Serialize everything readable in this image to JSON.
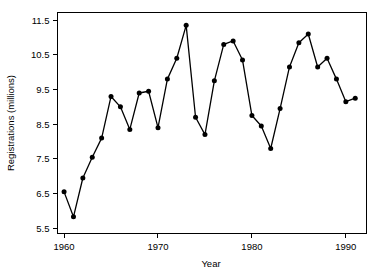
{
  "chart_data": {
    "type": "line",
    "title": "",
    "xlabel": "Year",
    "ylabel": "Registrations (millions)",
    "xlim": [
      1959.3,
      1992.2
    ],
    "ylim": [
      5.35,
      11.72
    ],
    "xticks": [
      1960,
      1970,
      1980,
      1990
    ],
    "xtick_labels": [
      "1960",
      "1970",
      "1980",
      "1990"
    ],
    "yticks": [
      5.5,
      6.5,
      7.5,
      8.5,
      9.5,
      10.5,
      11.5
    ],
    "ytick_labels": [
      "5.5",
      "6.5",
      "7.5",
      "8.5",
      "9.5",
      "10.5",
      "11.5"
    ],
    "grid": false,
    "legend": false,
    "marker": "filled-circle",
    "line_color": "#000000",
    "marker_color": "#000000",
    "background": "#ffffff",
    "x": [
      1960,
      1961,
      1962,
      1963,
      1964,
      1965,
      1966,
      1967,
      1968,
      1969,
      1970,
      1971,
      1972,
      1973,
      1974,
      1975,
      1976,
      1977,
      1978,
      1979,
      1980,
      1981,
      1982,
      1983,
      1984,
      1985,
      1986,
      1987,
      1988,
      1989,
      1990,
      1991
    ],
    "values": [
      6.55,
      5.83,
      6.95,
      7.55,
      8.1,
      9.3,
      9.0,
      8.35,
      9.4,
      9.45,
      8.4,
      9.8,
      10.4,
      11.35,
      8.7,
      8.2,
      9.75,
      10.8,
      10.9,
      10.35,
      8.75,
      8.45,
      7.8,
      8.95,
      10.15,
      10.85,
      11.1,
      10.15,
      10.4,
      9.8,
      9.15,
      9.25
    ],
    "series_name": "Registrations"
  },
  "axis": {
    "x_title": "Year",
    "y_title": "Registrations (millions)"
  }
}
